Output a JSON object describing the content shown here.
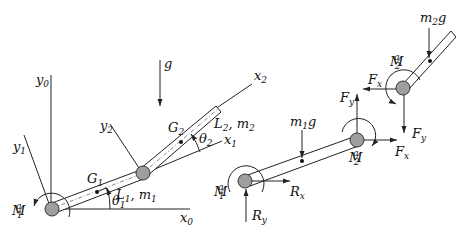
{
  "figure": {
    "left_panel": {
      "title": "Two-link planar arm",
      "labels": {
        "y0": "y",
        "y0_sub": "0",
        "x0": "x",
        "x0_sub": "0",
        "y1": "y",
        "y1_sub": "1",
        "x1": "x",
        "x1_sub": "1",
        "y2": "y",
        "y2_sub": "2",
        "x2": "x",
        "x2_sub": "2",
        "g": "g",
        "G1": "G",
        "G1_sub": "1",
        "G2": "G",
        "G2_sub": "2",
        "L1m1": "L",
        "L1m1_sub": "1",
        "L1m1_rest": ", m",
        "L1m1_sub2": "1",
        "L2m2": "L",
        "L2m2_sub": "2",
        "L2m2_rest": ", m",
        "L2m2_sub2": "2",
        "theta1": "θ",
        "theta1_sub": "1",
        "theta2": "θ",
        "theta2_sub": "2",
        "M1a": "M",
        "M1a_sub": "1",
        "M1a_sup": "a"
      }
    },
    "right_panel": {
      "title": "Free-body diagrams",
      "labels": {
        "m1g": "m",
        "m1g_sub": "1",
        "m1g_rest": "g",
        "m2g": "m",
        "m2g_sub": "2",
        "m2g_rest": "g",
        "M1a": "M",
        "M1a_sub": "1",
        "M1a_sup": "a",
        "M2a_lower": "M",
        "M2a_lower_sub": "2",
        "M2a_lower_sup": "a",
        "M2a_upper": "M",
        "M2a_upper_sub": "2",
        "M2a_upper_sup": "a",
        "Rx": "R",
        "Rx_sub": "x",
        "Ry": "R",
        "Ry_sub": "y",
        "Fx_lower": "F",
        "Fx_lower_sub": "x",
        "Fy_lower": "F",
        "Fy_lower_sub": "y",
        "Fx_upper": "F",
        "Fx_upper_sub": "x",
        "Fy_upper": "F",
        "Fy_upper_sub": "y"
      }
    }
  }
}
